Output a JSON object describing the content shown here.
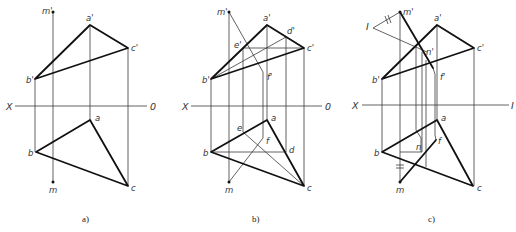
{
  "figure": {
    "panels": [
      {
        "id": "a",
        "caption": "a)",
        "axis": {
          "left": "X",
          "right": "0"
        },
        "labels": {
          "m_prime": "m'",
          "a_prime": "a'",
          "b_prime": "b'",
          "c_prime": "c'",
          "a": "a",
          "b": "b",
          "c": "c",
          "m": "m"
        }
      },
      {
        "id": "b",
        "caption": "b)",
        "axis": {
          "left": "X",
          "right": "0"
        },
        "labels": {
          "m_prime": "m'",
          "a_prime": "a'",
          "b_prime": "b'",
          "c_prime": "c'",
          "d_prime": "d'",
          "e_prime": "e'",
          "f_prime": "f'",
          "a": "a",
          "b": "b",
          "c": "c",
          "d": "d",
          "e": "e",
          "f": "f",
          "m": "m"
        }
      },
      {
        "id": "c",
        "caption": "c)",
        "axis": {
          "left": "X",
          "right": "I"
        },
        "labels": {
          "I": "I",
          "m_prime": "m'",
          "a_prime": "a'",
          "b_prime": "b'",
          "c_prime": "c'",
          "n_prime": "n'",
          "f_prime": "f'",
          "a": "a",
          "b": "b",
          "c": "c",
          "n": "n",
          "f": "f",
          "m": "m"
        }
      }
    ]
  }
}
